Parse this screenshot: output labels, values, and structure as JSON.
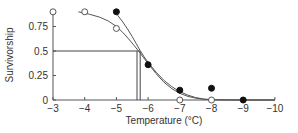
{
  "chart_data": {
    "type": "scatter",
    "title": "",
    "xlabel": "Temperature (°C)",
    "ylabel": "Survivorship",
    "xlim": [
      -3,
      -10
    ],
    "ylim": [
      0,
      0.9
    ],
    "x_ticks": [
      "−3",
      "−4",
      "−5",
      "−6",
      "−7",
      "−8",
      "−9",
      "−10"
    ],
    "x_tick_values": [
      -3,
      -4,
      -5,
      -6,
      -7,
      -8,
      -9,
      -10
    ],
    "y_ticks": [
      "0",
      "0.25",
      "0.5",
      "0.75"
    ],
    "y_tick_values": [
      0,
      0.25,
      0.5,
      0.75
    ],
    "grid": false,
    "legend": null,
    "series": [
      {
        "name": "open circles",
        "marker": "open-circle",
        "points": [
          [
            -3,
            0.9
          ],
          [
            -4,
            0.9
          ],
          [
            -5,
            0.73
          ],
          [
            -7,
            0
          ],
          [
            -8,
            0
          ]
        ],
        "fit_curve_x": [
          -3.8,
          -4.5,
          -5.0,
          -5.4,
          -5.7,
          -6.0,
          -6.5,
          -7.0,
          -7.5,
          -8.0,
          -10
        ],
        "fit_curve_y": [
          0.9,
          0.85,
          0.76,
          0.62,
          0.5,
          0.37,
          0.17,
          0.06,
          0.015,
          0.0,
          0.0
        ],
        "lt50": -5.65
      },
      {
        "name": "filled circles",
        "marker": "filled-circle",
        "points": [
          [
            -5,
            0.9
          ],
          [
            -6,
            0.36
          ],
          [
            -7,
            0.1
          ],
          [
            -8,
            0.12
          ],
          [
            -9,
            0
          ]
        ],
        "fit_curve_x": [
          -4.9,
          -5.2,
          -5.5,
          -5.75,
          -6.0,
          -6.5,
          -7.0,
          -7.5,
          -8.0,
          -10
        ],
        "fit_curve_y": [
          0.92,
          0.8,
          0.65,
          0.5,
          0.38,
          0.19,
          0.08,
          0.02,
          0.0,
          0.0
        ],
        "lt50": -5.75
      }
    ],
    "annotations": [
      {
        "type": "hline",
        "y": 0.5,
        "from_x": -3,
        "to_x": -5.75
      },
      {
        "type": "vline",
        "x": -5.65,
        "from_y": 0,
        "to_y": 0.5
      },
      {
        "type": "vline",
        "x": -5.75,
        "from_y": 0,
        "to_y": 0.5
      }
    ]
  }
}
